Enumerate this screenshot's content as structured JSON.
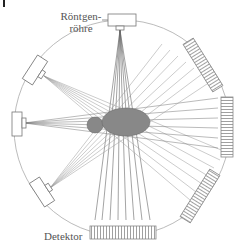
{
  "labels": {
    "tube_line1": "Röntgen-",
    "tube_line2": "röhre",
    "detector": "Detektor"
  },
  "colors": {
    "ring": "#aaaaaa",
    "beam": "#777777",
    "object": "#888888",
    "detector_fill": "#ffffff",
    "detector_stroke": "#888888"
  },
  "components": {
    "sources": 4,
    "detectors": 4,
    "objects": [
      "small-ellipse",
      "large-ellipse"
    ]
  }
}
